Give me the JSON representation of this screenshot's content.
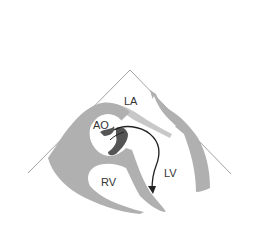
{
  "diagram": {
    "type": "echocardiography-schematic",
    "view": "parasternal-sector",
    "labels": {
      "la": "LA",
      "ao": "AO",
      "rv": "RV",
      "lv": "LV"
    },
    "colors": {
      "background": "#ffffff",
      "tissue": "#b0b0b0",
      "sector_line": "#8a8a8a",
      "mass": "#555555",
      "arrow": "#222222"
    },
    "annotations": [
      {
        "type": "arrow",
        "from": "AO",
        "to": "LV",
        "description": "flow arrow from aortic region into left ventricle"
      }
    ]
  }
}
